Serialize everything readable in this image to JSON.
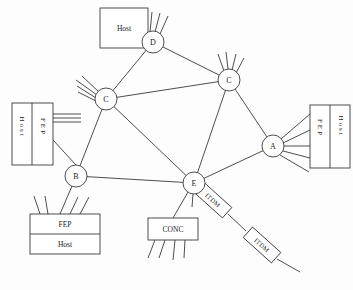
{
  "figure": {
    "type": "network-diagram",
    "background_color": "#fdfdfd",
    "line_color": "#3a3a3a",
    "text_color": "#1a1a1a"
  },
  "nodes": [
    {
      "id": "D",
      "label": "D",
      "x": 153,
      "y": 42,
      "r": 11
    },
    {
      "id": "C1",
      "label": "C",
      "x": 106,
      "y": 99,
      "r": 11
    },
    {
      "id": "C2",
      "label": "C",
      "x": 229,
      "y": 80,
      "r": 11
    },
    {
      "id": "A",
      "label": "A",
      "x": 273,
      "y": 146,
      "r": 11
    },
    {
      "id": "B",
      "label": "B",
      "x": 76,
      "y": 176,
      "r": 11
    },
    {
      "id": "E",
      "label": "E",
      "x": 194,
      "y": 183,
      "r": 11
    }
  ],
  "links": [
    {
      "from": "D",
      "to": "C1"
    },
    {
      "from": "D",
      "to": "C2"
    },
    {
      "from": "C1",
      "to": "C2"
    },
    {
      "from": "C1",
      "to": "B"
    },
    {
      "from": "C1",
      "to": "E"
    },
    {
      "from": "C2",
      "to": "E"
    },
    {
      "from": "C2",
      "to": "A"
    },
    {
      "from": "A",
      "to": "E"
    },
    {
      "from": "B",
      "to": "E"
    }
  ],
  "boxes": [
    {
      "id": "host-top",
      "labels": [
        "Host"
      ],
      "orientation": "single",
      "x": 100,
      "y": 8,
      "w": 48,
      "h": 40
    },
    {
      "id": "host-fep-left",
      "labels": [
        "Host",
        "FEP"
      ],
      "orientation": "vertical-split",
      "x": 12,
      "y": 103,
      "w": 41,
      "h": 62
    },
    {
      "id": "fep-host-right",
      "labels": [
        "FEP",
        "Host"
      ],
      "orientation": "vertical-split",
      "x": 310,
      "y": 105,
      "w": 40,
      "h": 63
    },
    {
      "id": "fep-host-bottom",
      "labels": [
        "FEP",
        "Host"
      ],
      "orientation": "horizontal-split",
      "x": 30,
      "y": 214,
      "w": 70,
      "h": 40
    },
    {
      "id": "conc",
      "labels": [
        "CONC"
      ],
      "orientation": "single",
      "x": 148,
      "y": 218,
      "w": 50,
      "h": 22
    }
  ],
  "itdm_boxes": [
    {
      "id": "itdm-1",
      "label": "ITDM",
      "cx": 213,
      "cy": 200,
      "w": 38,
      "h": 14,
      "rotate": 42
    },
    {
      "id": "itdm-2",
      "label": "ITDM",
      "cx": 262,
      "cy": 245,
      "w": 38,
      "h": 14,
      "rotate": 42
    }
  ],
  "counts": {
    "nodes": 6,
    "links": 9,
    "boxes": 5,
    "itdm_boxes": 2
  }
}
